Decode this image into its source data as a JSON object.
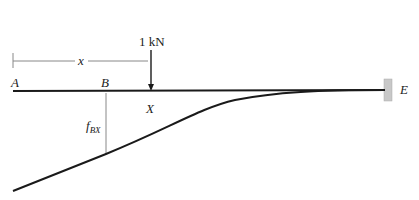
{
  "diagram": {
    "type": "cantilever influence line",
    "labels": {
      "A": "A",
      "B": "B",
      "X": "X",
      "E": "E",
      "x": "x",
      "load": "1 kN",
      "f_main": "f",
      "f_sub": "BX"
    },
    "colors": {
      "beam": "#1a1a1a",
      "curve": "#1a1a1a",
      "dimension": "#888888",
      "support": "#c8c8c8",
      "text": "#222222"
    }
  }
}
